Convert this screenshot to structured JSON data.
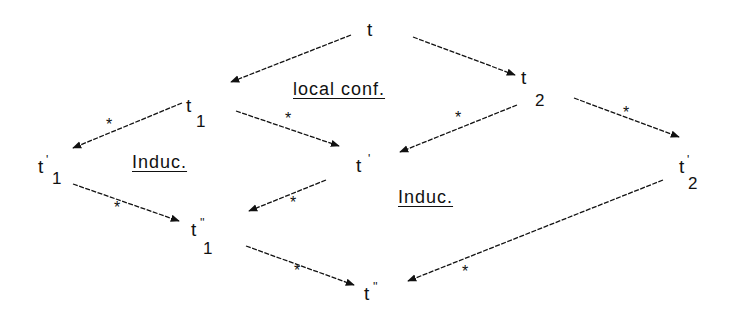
{
  "diagram": {
    "type": "commutative-diagram",
    "nodes": [
      {
        "id": "t",
        "label": "t",
        "sub": "",
        "prime": ""
      },
      {
        "id": "t1",
        "label": "t",
        "sub": "1",
        "prime": ""
      },
      {
        "id": "t2",
        "label": "t",
        "sub": "2",
        "prime": ""
      },
      {
        "id": "t1p",
        "label": "t",
        "sub": "1",
        "prime": "'"
      },
      {
        "id": "tp",
        "label": "t",
        "sub": "",
        "prime": "'"
      },
      {
        "id": "t2p",
        "label": "t",
        "sub": "2",
        "prime": "'"
      },
      {
        "id": "t1pp",
        "label": "t",
        "sub": "1",
        "prime": "''"
      },
      {
        "id": "tpp",
        "label": "t",
        "sub": "",
        "prime": "''"
      }
    ],
    "edges": [
      {
        "from": "t",
        "to": "t1",
        "star": false
      },
      {
        "from": "t",
        "to": "t2",
        "star": false
      },
      {
        "from": "t1",
        "to": "t1p",
        "star": true,
        "star_label": "*"
      },
      {
        "from": "t1",
        "to": "tp",
        "star": true,
        "star_label": "*"
      },
      {
        "from": "t2",
        "to": "tp",
        "star": true,
        "star_label": "*"
      },
      {
        "from": "t2",
        "to": "t2p",
        "star": true,
        "star_label": "*"
      },
      {
        "from": "t1p",
        "to": "t1pp",
        "star": true,
        "star_label": "*"
      },
      {
        "from": "tp",
        "to": "t1pp",
        "star": true,
        "star_label": "*"
      },
      {
        "from": "t1pp",
        "to": "tpp",
        "star": true,
        "star_label": "*"
      },
      {
        "from": "t2p",
        "to": "tpp",
        "star": true,
        "star_label": "*"
      }
    ],
    "regions": [
      {
        "id": "local-conf",
        "label": "local conf."
      },
      {
        "id": "induc-left",
        "label": "Induc."
      },
      {
        "id": "induc-right",
        "label": "Induc."
      }
    ],
    "star_symbol": "*",
    "colors": {
      "stroke": "#111111",
      "background": "#ffffff"
    }
  }
}
